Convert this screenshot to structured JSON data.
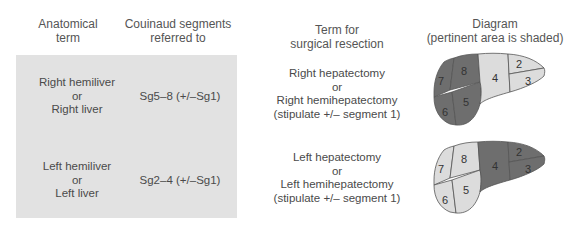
{
  "headers": {
    "anatomical": [
      "Anatomical",
      "term"
    ],
    "couinaud": [
      "Couinaud segments",
      "referred to"
    ],
    "surgical": [
      "Term for",
      "surgical resection"
    ],
    "diagram": [
      "Diagram",
      "(pertinent area is shaded)"
    ]
  },
  "rows": [
    {
      "anatomical": [
        "Right hemiliver",
        "or",
        "Right liver"
      ],
      "segments": "Sg5–8 (+/–Sg1)",
      "surgical": [
        "Right hepatectomy",
        "or",
        "Right hemihepatectomy",
        "(stipulate +/– segment 1)"
      ],
      "shaded_segments": [
        "5",
        "6",
        "7",
        "8"
      ]
    },
    {
      "anatomical": [
        "Left hemiliver",
        "or",
        "Left liver"
      ],
      "segments": "Sg2–4 (+/–Sg1)",
      "surgical": [
        "Left hepatectomy",
        "or",
        "Left hemihepatectomy",
        "(stipulate +/– segment 1)"
      ],
      "shaded_segments": [
        "2",
        "3",
        "4"
      ]
    }
  ],
  "segment_labels": {
    "s2": "2",
    "s3": "3",
    "s4": "4",
    "s5": "5",
    "s6": "6",
    "s7": "7",
    "s8": "8"
  },
  "colors": {
    "shaded": "#6e6e6e",
    "unshaded": "#dcdcdc",
    "outline": "#555555",
    "box_bg": "#e2e2e2"
  }
}
